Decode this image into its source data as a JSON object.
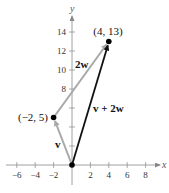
{
  "diagram": {
    "type": "vector-addition-plot",
    "axes": {
      "x_label": "x",
      "y_label": "y",
      "x_ticks": [
        -6,
        -4,
        -2,
        2,
        4,
        6,
        8
      ],
      "y_ticks": [
        2,
        4,
        6,
        8,
        10,
        12,
        14
      ],
      "x_tick_labels": [
        "−6",
        "−4",
        "−2",
        "2",
        "4",
        "6",
        "8"
      ],
      "y_tick_labels": [
        "14",
        "12",
        "10",
        "8",
        "6"
      ]
    },
    "points": [
      {
        "label": "(−2, 5)",
        "x": -2,
        "y": 5
      },
      {
        "label": "(4, 13)",
        "x": 4,
        "y": 13
      },
      {
        "label": "",
        "x": 0,
        "y": 0
      }
    ],
    "vectors": [
      {
        "name": "v",
        "label": "v",
        "from": [
          0,
          0
        ],
        "to": [
          -2,
          5
        ],
        "color": "#a8a8a8"
      },
      {
        "name": "2w",
        "label": "2w",
        "from": [
          -2,
          5
        ],
        "to": [
          4,
          13
        ],
        "color": "#a8a8a8"
      },
      {
        "name": "v+2w",
        "label": "v + 2w",
        "from": [
          0,
          0
        ],
        "to": [
          4,
          13
        ],
        "color": "#111111"
      }
    ],
    "colors": {
      "axis": "#888888",
      "component_vectors": "#a8a8a8",
      "resultant_vector": "#111111",
      "points": "#000000"
    }
  }
}
